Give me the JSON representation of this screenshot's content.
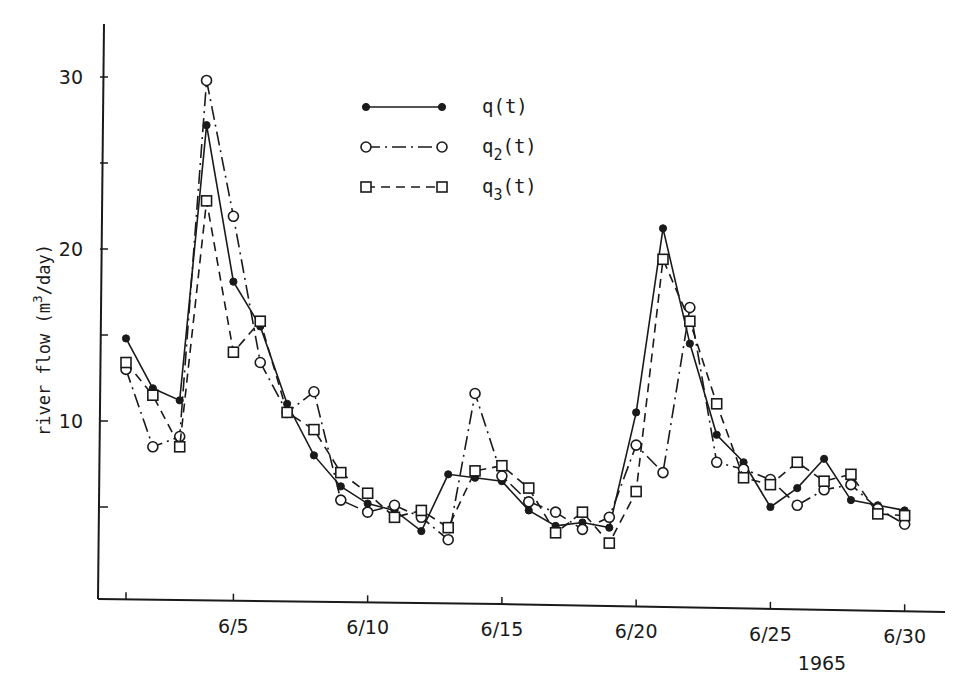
{
  "chart_data": {
    "type": "line",
    "title": "",
    "xlabel": "1965",
    "ylabel": "river flow (m3/day)",
    "ylabel_parts": {
      "main": "river flow (m",
      "sup": "3",
      "tail": "/day)"
    },
    "ylim": [
      0,
      32
    ],
    "xlim": [
      0,
      31.5
    ],
    "grid": false,
    "legend_position": "upper center",
    "y_ticks": [
      {
        "value": 5,
        "label": ""
      },
      {
        "value": 10,
        "label": "10"
      },
      {
        "value": 15,
        "label": ""
      },
      {
        "value": 20,
        "label": "20"
      },
      {
        "value": 25,
        "label": ""
      },
      {
        "value": 30,
        "label": "30"
      }
    ],
    "x_ticks": [
      {
        "value": 1,
        "label": ""
      },
      {
        "value": 5,
        "label": "6/5"
      },
      {
        "value": 10,
        "label": "6/10"
      },
      {
        "value": 15,
        "label": "6/15"
      },
      {
        "value": 20,
        "label": "6/20"
      },
      {
        "value": 25,
        "label": "6/25"
      },
      {
        "value": 30,
        "label": "6/30"
      }
    ],
    "x": [
      1,
      2,
      3,
      4,
      5,
      6,
      7,
      8,
      9,
      10,
      11,
      12,
      13,
      14,
      15,
      16,
      17,
      18,
      19,
      20,
      21,
      22,
      23,
      24,
      25,
      26,
      27,
      28,
      29,
      30
    ],
    "series": [
      {
        "name": "q(t)",
        "legend_main": "q",
        "legend_sub": "",
        "legend_tail": "(t)",
        "line_style": "solid",
        "marker": "filled-circle",
        "values": [
          14.8,
          11.9,
          11.2,
          27.2,
          18.1,
          15.5,
          11.0,
          8.0,
          6.2,
          5.2,
          4.8,
          3.6,
          6.9,
          6.7,
          6.5,
          4.8,
          3.9,
          4.1,
          3.8,
          10.5,
          21.2,
          14.5,
          9.2,
          7.6,
          5.0,
          6.1,
          7.8,
          5.4,
          5.1,
          4.8
        ]
      },
      {
        "name": "q2(t)",
        "legend_main": "q",
        "legend_sub": "2",
        "legend_tail": "(t)",
        "line_style": "dash-dot",
        "marker": "open-circle",
        "values": [
          13.0,
          8.5,
          9.1,
          29.8,
          21.9,
          13.4,
          10.5,
          11.7,
          5.4,
          4.7,
          5.1,
          4.4,
          3.1,
          11.6,
          6.8,
          5.3,
          4.7,
          3.7,
          4.4,
          8.6,
          7.0,
          16.6,
          7.6,
          7.2,
          6.6,
          5.1,
          6.0,
          6.3,
          4.9,
          4.0
        ]
      },
      {
        "name": "q3(t)",
        "legend_main": "q",
        "legend_sub": "3",
        "legend_tail": "(t)",
        "line_style": "dashed",
        "marker": "open-square",
        "values": [
          13.4,
          11.5,
          8.5,
          22.8,
          14.0,
          15.8,
          10.5,
          9.5,
          7.0,
          5.8,
          4.4,
          4.8,
          3.8,
          7.1,
          7.4,
          6.1,
          3.5,
          4.7,
          2.9,
          5.9,
          19.4,
          15.8,
          11.0,
          6.7,
          6.3,
          7.6,
          6.5,
          6.9,
          4.6,
          4.5
        ]
      }
    ]
  },
  "colors": {
    "ink": "#1a1a1a",
    "background": "#ffffff"
  }
}
